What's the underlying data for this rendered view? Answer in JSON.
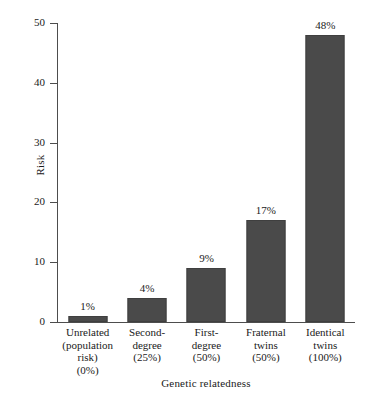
{
  "chart_data": {
    "type": "bar",
    "title": "",
    "xlabel": "Genetic relatedness",
    "ylabel": "Risk",
    "ylim": [
      0,
      50
    ],
    "yticks": [
      0,
      10,
      20,
      30,
      40,
      50
    ],
    "ytick_labels": [
      "0",
      "10",
      "20",
      "30",
      "40",
      "50"
    ],
    "grid": false,
    "legend": null,
    "bar_color": "#4a4a4a",
    "axis_color": "#4d4d4d",
    "categories": [
      "Unrelated (population risk) (0%)",
      "Second-degree (25%)",
      "First-degree (50%)",
      "Fraternal twins (50%)",
      "Identical twins (100%)"
    ],
    "category_lines": [
      [
        "Unrelated",
        "(population",
        "risk)",
        "(0%)"
      ],
      [
        "Second-",
        "degree",
        "(25%)"
      ],
      [
        "First-",
        "degree",
        "(50%)"
      ],
      [
        "Fraternal",
        "twins",
        "(50%)"
      ],
      [
        "Identical",
        "twins",
        "(100%)"
      ]
    ],
    "values": [
      1,
      4,
      9,
      17,
      48
    ],
    "data_labels": [
      "1%",
      "4%",
      "9%",
      "17%",
      "48%"
    ]
  },
  "axes": {
    "y_label": "Risk",
    "x_label": "Genetic relatedness"
  }
}
